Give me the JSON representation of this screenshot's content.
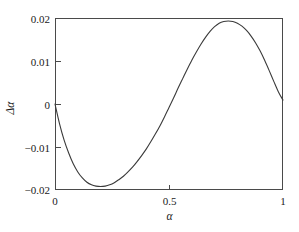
{
  "chart_data": {
    "type": "line",
    "title": "",
    "subtitle": "",
    "xlabel": "α",
    "ylabel": "Δα",
    "xlim": [
      0,
      1
    ],
    "ylim": [
      -0.02,
      0.02
    ],
    "grid": false,
    "legend": null,
    "legend_position": "none",
    "x_ticks": [
      0,
      0.5,
      1
    ],
    "x_tick_labels": [
      "0",
      "0.5",
      "1"
    ],
    "y_ticks": [
      -0.02,
      -0.01,
      0,
      0.01,
      0.02
    ],
    "y_tick_labels": [
      "−0.02",
      "−0.01",
      "0",
      "0.01",
      "0.02"
    ],
    "series": [
      {
        "name": "Δα",
        "x": [
          0.0,
          0.02,
          0.04,
          0.06,
          0.08,
          0.1,
          0.12,
          0.14,
          0.16,
          0.18,
          0.2,
          0.22,
          0.24,
          0.26,
          0.28,
          0.3,
          0.32,
          0.34,
          0.36,
          0.38,
          0.4,
          0.42,
          0.44,
          0.46,
          0.48,
          0.5,
          0.52,
          0.54,
          0.56,
          0.58,
          0.6,
          0.62,
          0.64,
          0.66,
          0.68,
          0.7,
          0.72,
          0.74,
          0.76,
          0.78,
          0.8,
          0.82,
          0.84,
          0.86,
          0.88,
          0.9,
          0.92,
          0.94,
          0.96,
          0.98,
          1.0
        ],
        "y": [
          0.0,
          -0.0046,
          -0.0084,
          -0.0114,
          -0.0139,
          -0.0158,
          -0.0172,
          -0.0182,
          -0.0188,
          -0.0191,
          -0.0192,
          -0.0191,
          -0.0188,
          -0.0183,
          -0.0176,
          -0.0168,
          -0.0158,
          -0.0147,
          -0.0134,
          -0.012,
          -0.0105,
          -0.0088,
          -0.007,
          -0.0051,
          -0.003,
          -0.0008,
          0.0014,
          0.0037,
          0.0059,
          0.0081,
          0.0102,
          0.0121,
          0.0139,
          0.0155,
          0.0169,
          0.018,
          0.0188,
          0.0192,
          0.0193,
          0.0192,
          0.0188,
          0.0181,
          0.0171,
          0.0158,
          0.0142,
          0.0123,
          0.0101,
          0.0077,
          0.0052,
          0.0028,
          0.0009
        ]
      }
    ],
    "annotations": {
      "minimum": {
        "x": 0.21,
        "y": -0.0192
      },
      "maximum": {
        "x": 0.79,
        "y": 0.0193
      },
      "zero_crossing": {
        "x": 0.507,
        "y": 0.0
      },
      "start_point": {
        "x": 0.0,
        "y": 0.0
      },
      "end_point": {
        "x": 1.0,
        "y": 0.0009
      }
    },
    "style": {
      "curve_color": "#3a3a3a",
      "axis_color": "#4a4a4a",
      "background_color": "#ffffff",
      "text_color": "#1a1a1a"
    }
  },
  "figure": {
    "plot_left": 55,
    "plot_right": 283,
    "plot_top": 18,
    "plot_bottom": 190
  }
}
